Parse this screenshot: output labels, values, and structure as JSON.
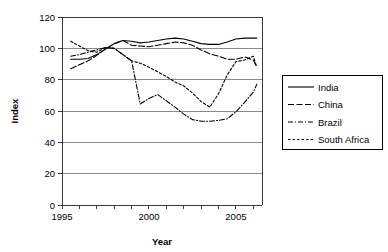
{
  "chart_data": {
    "type": "line",
    "title": "",
    "xlabel": "Year",
    "ylabel": "Index",
    "xlim": [
      1995,
      2006.5
    ],
    "ylim": [
      0,
      120
    ],
    "ytick_step": 20,
    "grid": true,
    "legend_position": "right",
    "x_tick_labels": [
      "1995",
      "2000",
      "2005"
    ],
    "x_tick_values": [
      1995,
      2000,
      2005
    ],
    "x_minor_ticks": [
      1995,
      1996,
      1997,
      1998,
      1999,
      2000,
      2001,
      2002,
      2003,
      2004,
      2005,
      2006
    ],
    "y_tick_labels": [
      "0",
      "20",
      "40",
      "60",
      "80",
      "100",
      "120"
    ],
    "y_tick_values": [
      0,
      20,
      40,
      60,
      80,
      100,
      120
    ],
    "x": [
      1995.5,
      1996,
      1996.5,
      1997,
      1997.5,
      1998,
      1998.5,
      1999,
      1999.5,
      2000,
      2000.5,
      2001,
      2001.5,
      2002,
      2002.5,
      2003,
      2003.5,
      2004,
      2004.5,
      2005,
      2005.5,
      2006,
      2006.2
    ],
    "series": [
      {
        "name": "India",
        "style": "solid",
        "values": [
          93,
          93,
          93.5,
          96,
          99.5,
          103,
          105,
          104.5,
          103.5,
          104,
          105,
          106,
          106.5,
          106,
          104.5,
          103,
          102.5,
          102.5,
          104,
          106,
          106.5,
          106.5,
          106.5
        ]
      },
      {
        "name": "China",
        "style": "dashed",
        "values": [
          87,
          89.5,
          92,
          95.5,
          99.5,
          103,
          105,
          102,
          101.5,
          101,
          102,
          103,
          104,
          103.5,
          102,
          99,
          96.5,
          95,
          93,
          93,
          94.5,
          92.5,
          88
        ]
      },
      {
        "name": "Brazil",
        "style": "dashdot",
        "values": [
          95,
          96,
          97.5,
          99,
          100.5,
          100,
          96,
          92,
          64.5,
          68,
          70.5,
          66.5,
          62.5,
          58,
          54.5,
          53.5,
          53.5,
          54,
          55,
          59.5,
          65.5,
          72,
          77
        ]
      },
      {
        "name": "South Africa",
        "style": "dotted",
        "values": [
          104.5,
          101.5,
          98.5,
          97.5,
          100.5,
          100,
          96,
          92,
          90.5,
          88,
          85,
          82,
          78.5,
          76,
          71.5,
          66,
          62.5,
          71,
          83,
          91.5,
          92.5,
          95,
          88
        ]
      }
    ]
  },
  "legend": {
    "items": [
      {
        "label": "India"
      },
      {
        "label": "China"
      },
      {
        "label": "Brazil"
      },
      {
        "label": "South Africa"
      }
    ]
  }
}
